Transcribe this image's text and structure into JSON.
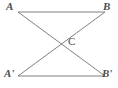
{
  "figure": {
    "type": "geometry-diagram",
    "background_color": "#ffffff",
    "stroke_color": "#808080",
    "label_color": "#4d4d4d",
    "stroke_width": 1,
    "width": 118,
    "height": 88,
    "points": {
      "A": {
        "label": "A",
        "x": 18,
        "y": 12
      },
      "B": {
        "label": "B",
        "x": 105,
        "y": 12
      },
      "A_prime": {
        "label": "A'",
        "x": 18,
        "y": 76
      },
      "B_prime": {
        "label": "B'",
        "x": 105,
        "y": 76
      },
      "C": {
        "label": "C",
        "x": 62,
        "y": 43
      }
    },
    "segments": [
      {
        "name": "top-segment",
        "from": "A",
        "to": "B"
      },
      {
        "name": "bottom-segment",
        "from": "A_prime",
        "to": "B_prime"
      },
      {
        "name": "diagonal-a-bprime",
        "from": "A",
        "to": "B_prime"
      },
      {
        "name": "diagonal-aprime-b",
        "from": "A_prime",
        "to": "B"
      }
    ]
  }
}
